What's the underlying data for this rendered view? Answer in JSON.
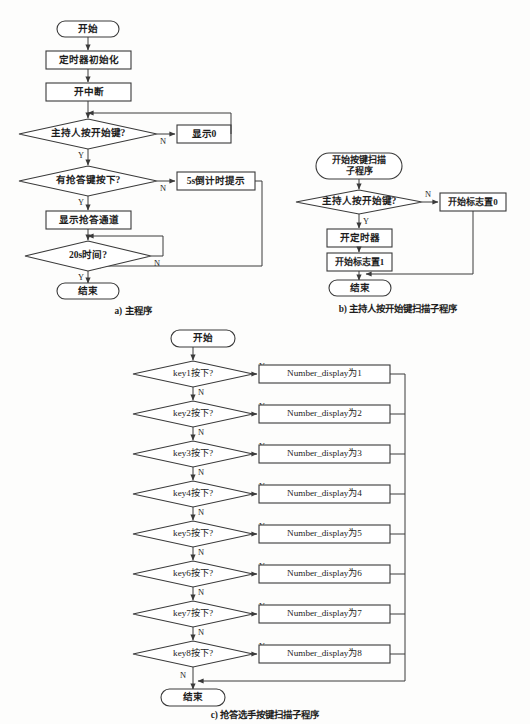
{
  "page": {
    "background": "#fdfdfc",
    "ink": "#1d1d1d",
    "stroke": "#3a3a3a",
    "width": 530,
    "height": 724
  },
  "labels": {
    "yes": "Y",
    "no": "N"
  },
  "captions": {
    "a": "a) 主程序",
    "b": "b) 主持人按开始键扫描子程序",
    "c": "c) 抢答选手按键扫描子程序"
  },
  "chart_data": {
    "type": "diagram",
    "diagram_kind": "flowchart",
    "panels": [
      {
        "id": "a",
        "caption": "a) 主程序",
        "nodes": [
          {
            "id": "a1",
            "shape": "terminator",
            "text": "开始"
          },
          {
            "id": "a2",
            "shape": "process",
            "text": "定时器初始化"
          },
          {
            "id": "a3",
            "shape": "process",
            "text": "开中断"
          },
          {
            "id": "a4",
            "shape": "decision",
            "text": "主持人按开始键?"
          },
          {
            "id": "a5",
            "shape": "process",
            "text": "显示0"
          },
          {
            "id": "a6",
            "shape": "decision",
            "text": "有抢答键按下?"
          },
          {
            "id": "a7",
            "shape": "process",
            "text": "5s倒计时提示"
          },
          {
            "id": "a8",
            "shape": "process",
            "text": "显示抢答通道"
          },
          {
            "id": "a9",
            "shape": "decision",
            "text": "20s时间?"
          },
          {
            "id": "a10",
            "shape": "terminator",
            "text": "结束"
          }
        ],
        "edges": [
          {
            "from": "a1",
            "to": "a2",
            "label": ""
          },
          {
            "from": "a2",
            "to": "a3",
            "label": ""
          },
          {
            "from": "a3",
            "to": "a4",
            "label": ""
          },
          {
            "from": "a4",
            "to": "a5",
            "label": "N"
          },
          {
            "from": "a5",
            "to": "a3",
            "label": ""
          },
          {
            "from": "a4",
            "to": "a6",
            "label": "Y"
          },
          {
            "from": "a6",
            "to": "a7",
            "label": "N"
          },
          {
            "from": "a7",
            "to": "a10",
            "label": ""
          },
          {
            "from": "a6",
            "to": "a8",
            "label": "Y"
          },
          {
            "from": "a8",
            "to": "a9",
            "label": ""
          },
          {
            "from": "a9",
            "to": "a8",
            "label": "N"
          },
          {
            "from": "a9",
            "to": "a10",
            "label": "Y"
          }
        ]
      },
      {
        "id": "b",
        "caption": "b) 主持人按开始键扫描子程序",
        "nodes": [
          {
            "id": "b1",
            "shape": "terminator",
            "text": "开始按键扫描\n子程序"
          },
          {
            "id": "b2",
            "shape": "decision",
            "text": "主持人按开始键?"
          },
          {
            "id": "b3",
            "shape": "process",
            "text": "开始标志置0"
          },
          {
            "id": "b4",
            "shape": "process",
            "text": "开定时器"
          },
          {
            "id": "b5",
            "shape": "process",
            "text": "开始标志置1"
          },
          {
            "id": "b6",
            "shape": "terminator",
            "text": "结束"
          }
        ],
        "edges": [
          {
            "from": "b1",
            "to": "b2",
            "label": ""
          },
          {
            "from": "b2",
            "to": "b3",
            "label": "N"
          },
          {
            "from": "b2",
            "to": "b4",
            "label": "Y"
          },
          {
            "from": "b4",
            "to": "b5",
            "label": ""
          },
          {
            "from": "b5",
            "to": "b6",
            "label": ""
          },
          {
            "from": "b3",
            "to": "b6",
            "label": ""
          }
        ]
      },
      {
        "id": "c",
        "caption": "c) 抢答选手按键扫描子程序",
        "nodes": [
          {
            "id": "c0",
            "shape": "terminator",
            "text": "开始"
          },
          {
            "id": "c1",
            "shape": "decision",
            "text": "key1按下?"
          },
          {
            "id": "c1r",
            "shape": "process",
            "text": "Number_display为1"
          },
          {
            "id": "c2",
            "shape": "decision",
            "text": "key2按下?"
          },
          {
            "id": "c2r",
            "shape": "process",
            "text": "Number_display为2"
          },
          {
            "id": "c3",
            "shape": "decision",
            "text": "key3按下?"
          },
          {
            "id": "c3r",
            "shape": "process",
            "text": "Number_display为3"
          },
          {
            "id": "c4",
            "shape": "decision",
            "text": "key4按下?"
          },
          {
            "id": "c4r",
            "shape": "process",
            "text": "Number_display为4"
          },
          {
            "id": "c5",
            "shape": "decision",
            "text": "key5按下?"
          },
          {
            "id": "c5r",
            "shape": "process",
            "text": "Number_display为5"
          },
          {
            "id": "c6",
            "shape": "decision",
            "text": "key6按下?"
          },
          {
            "id": "c6r",
            "shape": "process",
            "text": "Number_display为6"
          },
          {
            "id": "c7",
            "shape": "decision",
            "text": "key7按下?"
          },
          {
            "id": "c7r",
            "shape": "process",
            "text": "Number_display为7"
          },
          {
            "id": "c8",
            "shape": "decision",
            "text": "key8按下?"
          },
          {
            "id": "c8r",
            "shape": "process",
            "text": "Number_display为8"
          },
          {
            "id": "cEnd",
            "shape": "terminator",
            "text": "结束"
          }
        ],
        "edges": [
          {
            "from": "c0",
            "to": "c1",
            "label": ""
          },
          {
            "from": "c1",
            "to": "c1r",
            "label": "Y"
          },
          {
            "from": "c1",
            "to": "c2",
            "label": "N"
          },
          {
            "from": "c2",
            "to": "c2r",
            "label": "Y"
          },
          {
            "from": "c2",
            "to": "c3",
            "label": "N"
          },
          {
            "from": "c3",
            "to": "c3r",
            "label": "Y"
          },
          {
            "from": "c3",
            "to": "c4",
            "label": "N"
          },
          {
            "from": "c4",
            "to": "c4r",
            "label": "Y"
          },
          {
            "from": "c4",
            "to": "c5",
            "label": "N"
          },
          {
            "from": "c5",
            "to": "c5r",
            "label": "Y"
          },
          {
            "from": "c5",
            "to": "c6",
            "label": "N"
          },
          {
            "from": "c6",
            "to": "c6r",
            "label": "Y"
          },
          {
            "from": "c6",
            "to": "c7",
            "label": "N"
          },
          {
            "from": "c7",
            "to": "c7r",
            "label": "Y"
          },
          {
            "from": "c7",
            "to": "c8",
            "label": "N"
          },
          {
            "from": "c8",
            "to": "c8r",
            "label": "Y"
          },
          {
            "from": "c8",
            "to": "cEnd",
            "label": "N"
          },
          {
            "from": "c1r",
            "to": "cEnd",
            "label": ""
          },
          {
            "from": "c2r",
            "to": "cEnd",
            "label": ""
          },
          {
            "from": "c3r",
            "to": "cEnd",
            "label": ""
          },
          {
            "from": "c4r",
            "to": "cEnd",
            "label": ""
          },
          {
            "from": "c5r",
            "to": "cEnd",
            "label": ""
          },
          {
            "from": "c6r",
            "to": "cEnd",
            "label": ""
          },
          {
            "from": "c7r",
            "to": "cEnd",
            "label": ""
          },
          {
            "from": "c8r",
            "to": "cEnd",
            "label": ""
          }
        ]
      }
    ]
  },
  "panel_a": {
    "n1": "开始",
    "n2": "定时器初始化",
    "n3": "开中断",
    "n4": "主持人按开始键?",
    "n5": "显示0",
    "n6": "有抢答键按下?",
    "n7": "5s倒计时提示",
    "n8": "显示抢答通道",
    "n9": "20s时间?",
    "n10": "结束",
    "e_n1": "N",
    "e_y1": "Y",
    "e_n2": "N",
    "e_y2": "Y",
    "e_n3": "N",
    "e_y3": "Y"
  },
  "panel_b": {
    "n1_line1": "开始按键扫描",
    "n1_line2": "子程序",
    "n2": "主持人按开始键?",
    "n3": "开始标志置0",
    "n4": "开定时器",
    "n5": "开始标志置1",
    "n6": "结束",
    "e_n": "N",
    "e_y": "Y"
  },
  "panel_c": {
    "start": "开始",
    "end": "结束",
    "rows": [
      {
        "cond": "key1按下?",
        "action": "Number_display为1",
        "yes": "Y",
        "no": "N"
      },
      {
        "cond": "key2按下?",
        "action": "Number_display为2",
        "yes": "Y",
        "no": "N"
      },
      {
        "cond": "key3按下?",
        "action": "Number_display为3",
        "yes": "Y",
        "no": "N"
      },
      {
        "cond": "key4按下?",
        "action": "Number_display为4",
        "yes": "Y",
        "no": "N"
      },
      {
        "cond": "key5按下?",
        "action": "Number_display为5",
        "yes": "Y",
        "no": "N"
      },
      {
        "cond": "key6按下?",
        "action": "Number_display为6",
        "yes": "Y",
        "no": "N"
      },
      {
        "cond": "key7按下?",
        "action": "Number_display为7",
        "yes": "Y",
        "no": "N"
      },
      {
        "cond": "key8按下?",
        "action": "Number_display为8",
        "yes": "Y",
        "no": "N"
      }
    ],
    "last_no": "N"
  }
}
